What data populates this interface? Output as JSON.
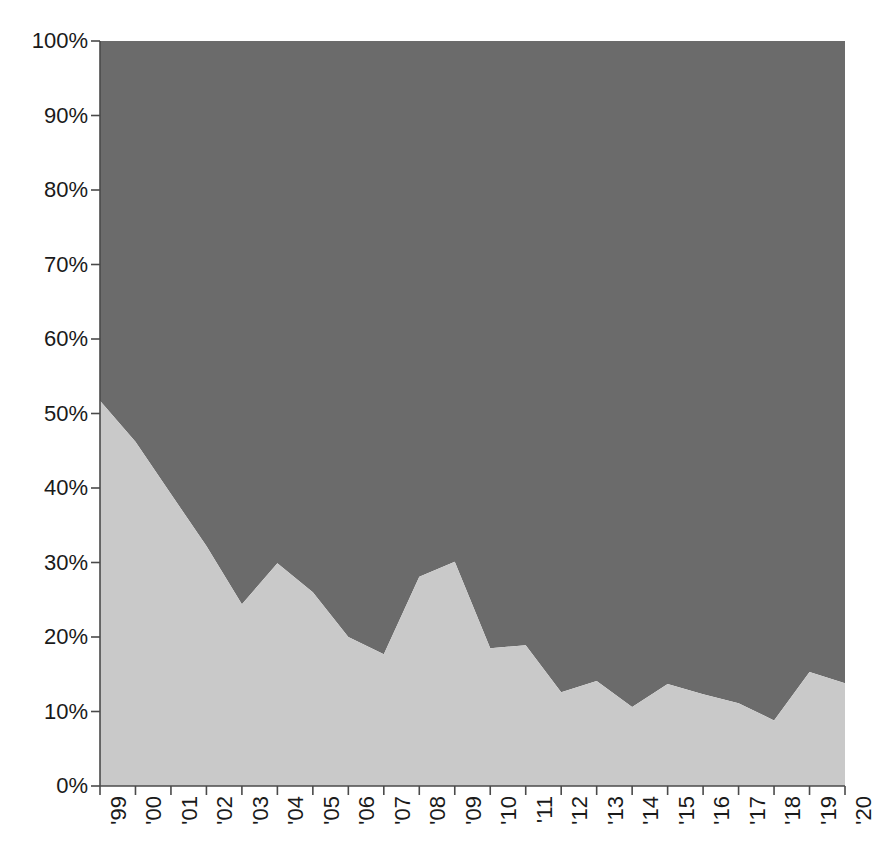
{
  "chart_data": {
    "type": "area",
    "stacked": true,
    "normalized": true,
    "title": "",
    "xlabel": "",
    "ylabel": "",
    "ylim": [
      0,
      100
    ],
    "grid": false,
    "legend": "none",
    "x": [
      "'99",
      "'00",
      "'01",
      "'02",
      "'03",
      "'04",
      "'05",
      "'06",
      "'07",
      "'08",
      "'09",
      "'10",
      "'11",
      "'12",
      "'13",
      "'14",
      "'15",
      "'16",
      "'17",
      "'18",
      "'19",
      "'20"
    ],
    "y_tick_labels": [
      "0%",
      "10%",
      "20%",
      "30%",
      "40%",
      "50%",
      "60%",
      "70%",
      "80%",
      "90%",
      "100%"
    ],
    "y_tick_values": [
      0,
      10,
      20,
      30,
      40,
      50,
      60,
      70,
      80,
      90,
      100
    ],
    "series": [
      {
        "name": "lower-share",
        "color": "#c9c9c9",
        "values": [
          51.7,
          46.2,
          39.2,
          32.2,
          24.4,
          29.9,
          26.0,
          20.0,
          17.7,
          28.1,
          30.1,
          18.5,
          18.9,
          12.6,
          14.1,
          10.6,
          13.7,
          12.3,
          11.1,
          8.8,
          15.3,
          13.8
        ]
      },
      {
        "name": "upper-share",
        "color": "#6b6b6b",
        "values": [
          48.3,
          53.8,
          60.8,
          67.8,
          75.6,
          70.1,
          74.0,
          80.0,
          82.3,
          71.9,
          69.9,
          81.5,
          81.1,
          87.4,
          85.9,
          89.4,
          86.3,
          87.7,
          88.9,
          91.2,
          84.7,
          86.2
        ]
      }
    ],
    "colors": {
      "upper_area": "#6b6b6b",
      "lower_area": "#c9c9c9",
      "axis": "#4a4a4a",
      "text": "#1a1a1a",
      "background": "#ffffff"
    },
    "geometry": {
      "plot_left": 100,
      "plot_right": 845,
      "plot_top": 41,
      "plot_bottom": 786
    }
  }
}
